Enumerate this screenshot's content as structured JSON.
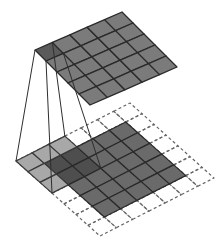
{
  "diagram": {
    "type": "convolution-illustration",
    "input": {
      "rows": 5,
      "cols": 5,
      "color": "#6a6a6a"
    },
    "padding": {
      "size": 1,
      "grid_rows": 7,
      "grid_cols": 7,
      "style": "dashed",
      "color": "#666666"
    },
    "kernel": {
      "rows": 3,
      "cols": 3,
      "color": "#a8a8a8",
      "overlap_color": "#4e4e4e"
    },
    "output": {
      "rows": 5,
      "cols": 5,
      "color": "#7b7b7b",
      "active_cell_color": "#5a5a5a"
    },
    "line_color": "#2e2e2e"
  }
}
